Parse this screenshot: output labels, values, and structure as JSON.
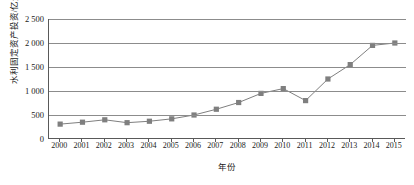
{
  "chart_data": {
    "type": "line",
    "title": "",
    "xlabel": "年份",
    "ylabel": "水利固定资产投资/亿元",
    "categories": [
      "2000",
      "2001",
      "2002",
      "2003",
      "2004",
      "2005",
      "2006",
      "2007",
      "2008",
      "2009",
      "2010",
      "2011",
      "2012",
      "2013",
      "2014",
      "2015"
    ],
    "values": [
      310,
      350,
      400,
      340,
      370,
      420,
      500,
      620,
      760,
      950,
      1050,
      800,
      1250,
      1550,
      1950,
      2000
    ],
    "ylim": [
      0,
      2500
    ],
    "yticks": [
      0,
      500,
      1000,
      1500,
      2000,
      2500
    ],
    "ytick_labels": [
      "0",
      "500",
      "1 000",
      "1 500",
      "2 000",
      "2 500"
    ],
    "grid": true,
    "legend": "none",
    "series_color": "#7f7f7f",
    "marker": "square"
  },
  "axis": {
    "y_title": "水利固定资产投资/亿元",
    "x_title": "年份"
  }
}
